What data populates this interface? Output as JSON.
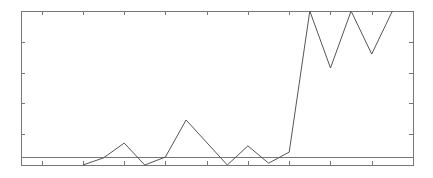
{
  "chart_data": {
    "type": "line",
    "title": "",
    "xlabel": "",
    "ylabel": "",
    "grid": false,
    "legend": null,
    "xlim": [
      0,
      19
    ],
    "ylim": [
      0,
      5
    ],
    "x_ticks": [
      1,
      3,
      5,
      7,
      9,
      11,
      13,
      15,
      17
    ],
    "y_ticks": [
      1,
      2,
      3,
      4
    ],
    "tick_labels_visible": false,
    "reference_line": {
      "orientation": "horizontal",
      "y": 0.26
    },
    "series": [
      {
        "name": "series-1",
        "x": [
          3,
          4,
          5,
          6,
          7,
          8,
          10,
          11,
          12,
          13,
          14,
          15,
          16,
          17,
          18
        ],
        "values": [
          0.0,
          0.23,
          0.71,
          0.0,
          0.26,
          1.46,
          0.0,
          0.62,
          0.06,
          0.42,
          5.0,
          3.15,
          5.0,
          3.6,
          5.0
        ]
      }
    ],
    "frame": {
      "left": 21,
      "top": 11,
      "right": 413,
      "bottom": 165
    },
    "colors": {
      "line": "#555555",
      "axis": "#777777",
      "background": "#ffffff"
    }
  }
}
